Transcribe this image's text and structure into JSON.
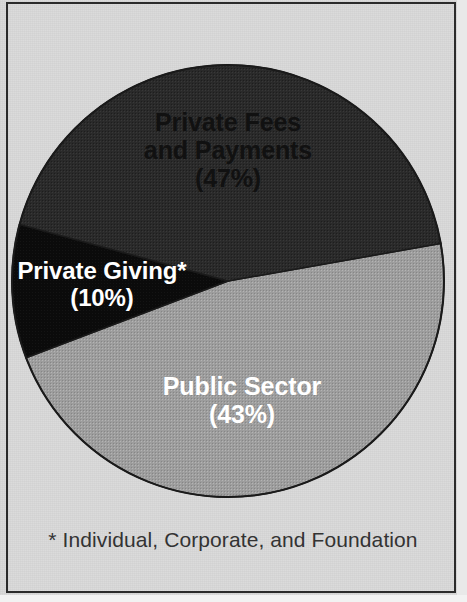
{
  "chart_data": {
    "type": "pie",
    "title": "",
    "subtitle": "",
    "categories": [
      "Private Fees and Payments",
      "Private Giving*",
      "Public Sector"
    ],
    "values": [
      47,
      43,
      10
    ],
    "unit": "%",
    "slices": [
      {
        "name": "private-fees-and-payments",
        "label_line1": "Private Fees",
        "label_line2": "and Payments",
        "value_label": "(47%)",
        "value": 47,
        "color": "#9d9d9d",
        "text_color": "#111111",
        "start_angle": -10,
        "sweep": 169.2
      },
      {
        "name": "private-giving",
        "label_line1": "Private Giving*",
        "label_line2": "",
        "value_label": "(10%)",
        "value": 10,
        "color": "#0b0b0b",
        "text_color": "#ffffff",
        "start_angle": 159.2,
        "sweep": 36
      },
      {
        "name": "public-sector",
        "label_line1": "Public Sector",
        "label_line2": "",
        "value_label": "(43%)",
        "value": 43,
        "color": "#2a2a2a",
        "text_color": "#ffffff",
        "start_angle": 195.2,
        "sweep": 154.8
      }
    ],
    "legend_position": "inside-slices",
    "grid": false,
    "xlabel": "",
    "ylabel": ""
  },
  "figure": {
    "footnote": "* Individual, Corporate, and Foundation",
    "background_color": "#d9d9d9",
    "frame_color": "#2b2b2b"
  },
  "labels": {
    "private_fees": {
      "line1": "Private Fees",
      "line2": "and Payments",
      "percent": "(47%)"
    },
    "private_giving": {
      "line1": "Private Giving*",
      "percent": "(10%)"
    },
    "public_sector": {
      "line1": "Public Sector",
      "percent": "(43%)"
    }
  }
}
